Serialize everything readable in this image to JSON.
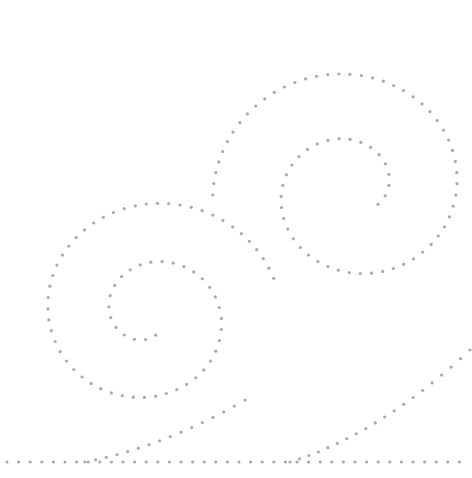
{
  "illustration": {
    "title": "Dotted spirals",
    "dot_color": "#a9a9a9",
    "background": "#ffffff",
    "dot_radius": 1.6,
    "spirals": [
      {
        "name": "upper-right-spiral",
        "cx": 352,
        "cy": 190,
        "start_radius": 30,
        "end_radius": 140,
        "start_angle_deg": 30,
        "turns": 1.6,
        "direction": "ccw",
        "spacing": 11
      },
      {
        "name": "lower-left-spiral",
        "cx": 150,
        "cy": 315,
        "start_radius": 22,
        "end_radius": 130,
        "start_angle_deg": 75,
        "turns": 1.75,
        "direction": "cw",
        "spacing": 11
      }
    ],
    "baseline": {
      "y": 462,
      "x_start": 7,
      "x_end": 462,
      "spacing": 11.6
    },
    "tail_lines": [
      {
        "name": "left-tail",
        "x1": 85,
        "y1": 462,
        "x2": 245,
        "y2": 400,
        "spacing": 11
      },
      {
        "name": "right-tail",
        "x1": 290,
        "y1": 462,
        "x2": 470,
        "y2": 350,
        "spacing": 11
      }
    ]
  }
}
